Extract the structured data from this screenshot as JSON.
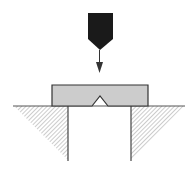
{
  "diagram": {
    "title": "Charpy impact test setup",
    "elements": {
      "hammer": {
        "label": "striker",
        "color": "#1a1a1a"
      },
      "arrow": {
        "label": "impact direction",
        "color": "#333333"
      },
      "specimen": {
        "label": "notched specimen",
        "fill": "#cccccc",
        "stroke": "#333333"
      },
      "notch": {
        "label": "V-notch"
      },
      "supports": {
        "label": "anvil supports",
        "hatch_color": "#999999",
        "stroke": "#444444"
      }
    },
    "colors": {
      "background": "#ffffff",
      "line": "#333333",
      "hatch": "#9a9a9a",
      "specimen_fill": "#cccccc",
      "hammer_fill": "#1a1a1a"
    }
  }
}
